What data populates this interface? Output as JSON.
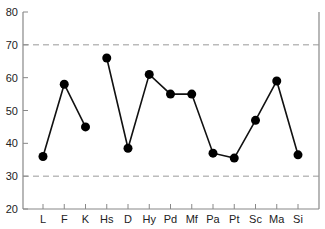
{
  "chart_data": {
    "type": "line",
    "title": "",
    "xlabel": "",
    "ylabel": "",
    "categories": [
      "L",
      "F",
      "K",
      "Hs",
      "D",
      "Hy",
      "Pd",
      "Mf",
      "Pa",
      "Pt",
      "Sc",
      "Ma",
      "Si"
    ],
    "series": [
      {
        "name": "profile",
        "segments": [
          [
            0,
            2
          ],
          [
            3,
            12
          ]
        ],
        "values": [
          36,
          58,
          45,
          66,
          38.5,
          61,
          55,
          55,
          37,
          35.5,
          47,
          59,
          36.5
        ]
      }
    ],
    "ylim": [
      20,
      80
    ],
    "yticks": [
      20,
      30,
      40,
      50,
      60,
      70,
      80
    ],
    "reference_lines": [
      {
        "y": 70,
        "style": "dashed"
      },
      {
        "y": 30,
        "style": "dashed"
      }
    ],
    "grid": false,
    "legend": null
  },
  "colors": {
    "line": "#111111",
    "marker": "#000000",
    "axis": "#888888",
    "reference": "#999999",
    "text": "#222222"
  }
}
